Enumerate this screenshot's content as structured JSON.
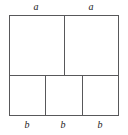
{
  "figure": {
    "geometry": {
      "outer": {
        "x": 9,
        "y": 15,
        "width": 110,
        "height": 101
      },
      "row_divider_y": 75,
      "top_row_divider_x": [
        64
      ],
      "bottom_row_divider_x": [
        45,
        82
      ]
    },
    "style": {
      "line_color": "#58585a",
      "fill_color": "#ffffff",
      "label_color": "#1a1a1a",
      "background": "#ffffff"
    },
    "top_labels": [
      {
        "text": "a",
        "center_x": 36
      },
      {
        "text": "a",
        "center_x": 91
      }
    ],
    "bottom_labels": [
      {
        "text": "b",
        "center_x": 27
      },
      {
        "text": "b",
        "center_x": 63
      },
      {
        "text": "b",
        "center_x": 100
      }
    ],
    "cells": {
      "top_row_count": 2,
      "bottom_row_count": 3
    }
  }
}
